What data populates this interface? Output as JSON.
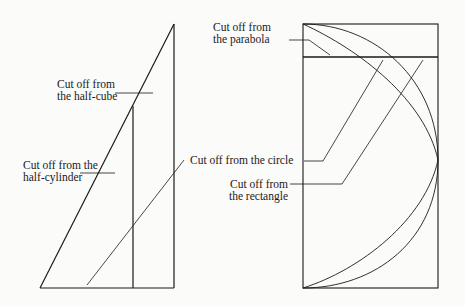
{
  "diagram": {
    "left_figure": {
      "description": "Right triangle with inner vertical line",
      "labels": {
        "half_cube_line1": "Cut off from",
        "half_cube_line2": "the half-cube",
        "half_cylinder_line1": "Cut off from the",
        "half_cylinder_line2": "half-cylinder",
        "circle": "Cut off from the circle"
      }
    },
    "right_figure": {
      "description": "Rectangle with circle arc and parabola curves",
      "labels": {
        "parabola_line1": "Cut off from",
        "parabola_line2": "the parabola",
        "rectangle_line1": "Cut off from",
        "rectangle_line2": "the rectangle"
      }
    },
    "colors": {
      "stroke": "#1a1a1a",
      "background": "#fbfbfa"
    }
  }
}
